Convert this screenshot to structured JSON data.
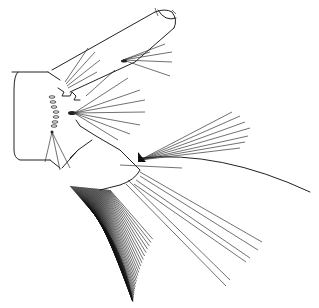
{
  "figure": {
    "colors": {
      "background": "#ffffff",
      "ink": "#222222"
    }
  }
}
